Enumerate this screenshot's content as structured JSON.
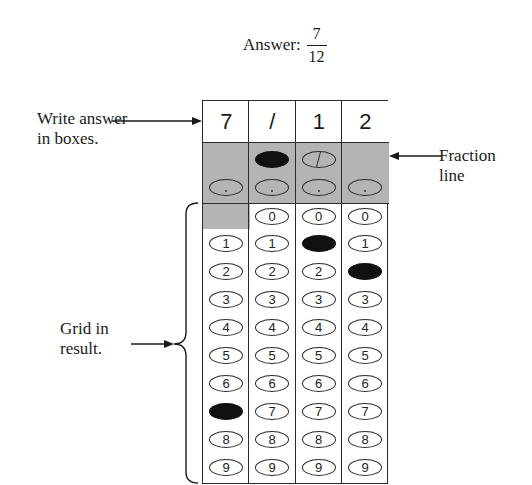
{
  "header": {
    "answer_label": "Answer:",
    "answer_numerator": "7",
    "answer_denominator": "12"
  },
  "annotations": {
    "write_answer_line1": "Write answer",
    "write_answer_line2": "in boxes.",
    "fraction_line_line1": "Fraction",
    "fraction_line_line2": "line",
    "grid_result_line1": "Grid in",
    "grid_result_line2": "result."
  },
  "grid": {
    "columns": [
      {
        "box": "7",
        "fraction_bubble": "none",
        "fraction_filled": false,
        "decimal_filled": false,
        "has_zero": false,
        "filled_digit": "7"
      },
      {
        "box": "/",
        "fraction_bubble": "filled",
        "fraction_filled": true,
        "decimal_filled": false,
        "has_zero": true,
        "filled_digit": null
      },
      {
        "box": "1",
        "fraction_bubble": "slash",
        "fraction_filled": false,
        "decimal_filled": false,
        "has_zero": true,
        "filled_digit": "1"
      },
      {
        "box": "2",
        "fraction_bubble": "none",
        "fraction_filled": false,
        "decimal_filled": false,
        "has_zero": true,
        "filled_digit": "2"
      }
    ],
    "digits": [
      "0",
      "1",
      "2",
      "3",
      "4",
      "5",
      "6",
      "7",
      "8",
      "9"
    ],
    "colors": {
      "shade": "#b4b4b4",
      "filled": "#111111",
      "border": "#2a2a2a"
    }
  }
}
